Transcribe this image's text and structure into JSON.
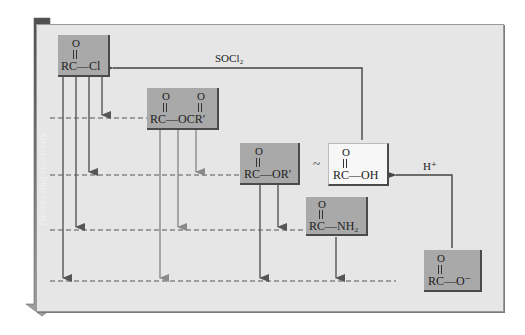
{
  "figure": {
    "side_label": "Decreasing reactivity",
    "reagents": {
      "socl2": "SOCl₂",
      "h_plus": "H⁺"
    },
    "tilde": "~",
    "compounds": [
      {
        "id": "acyl-chloride",
        "carbonyl": "O",
        "formula": "RC—Cl"
      },
      {
        "id": "anhydride",
        "carbonyl": "O",
        "carbonyl2": "O",
        "formula": "RC—OCR′"
      },
      {
        "id": "ester",
        "carbonyl": "O",
        "formula": "RC—OR′"
      },
      {
        "id": "carboxylic-acid",
        "carbonyl": "O",
        "formula": "RC—OH"
      },
      {
        "id": "amide",
        "carbonyl": "O",
        "formula": "RC—NH₂"
      },
      {
        "id": "carboxylate",
        "carbonyl": "O",
        "formula": "RC—O⁻"
      }
    ],
    "colors": {
      "panel": "#e6e6e6",
      "box": "#a9a9a9",
      "acid_box": "#f7f7f7",
      "arrow_dark": "#555555",
      "arrow_light": "#8a8a8a",
      "dash": "#555555"
    }
  }
}
